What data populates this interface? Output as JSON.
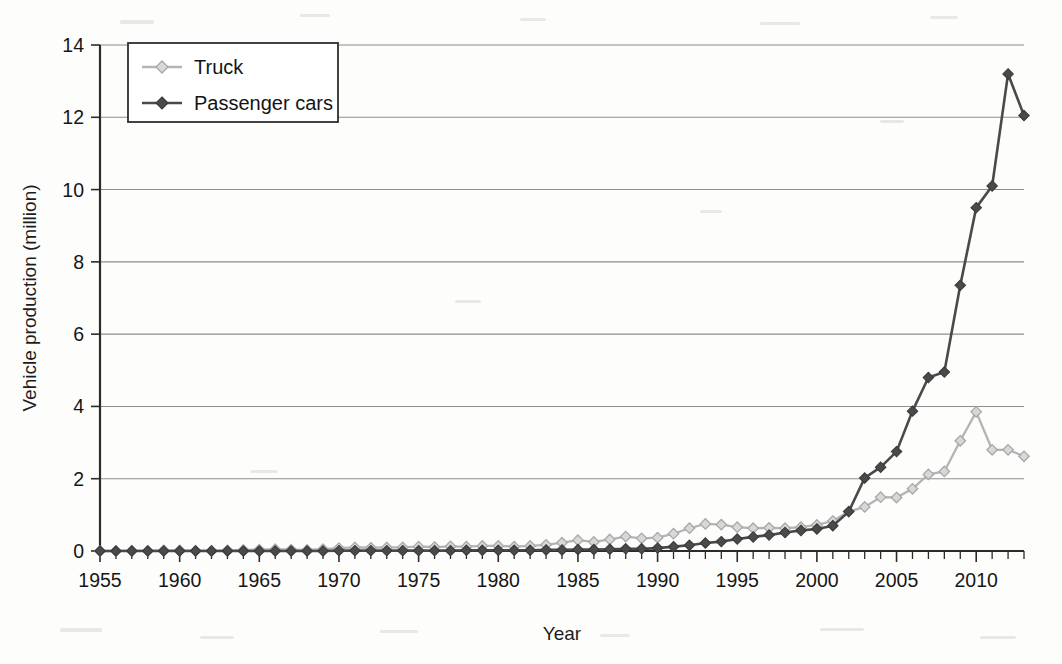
{
  "figure": {
    "background_color": "#fdfdfc",
    "kind": "scanned-line-chart"
  },
  "chart_data": {
    "type": "line",
    "title": "",
    "subtitle": "",
    "xlabel": "Year",
    "ylabel": "Vehicle production (million)",
    "xlim": [
      1955,
      2013
    ],
    "ylim": [
      0,
      14
    ],
    "xticks": [
      1955,
      1960,
      1965,
      1970,
      1975,
      1980,
      1985,
      1990,
      1995,
      2000,
      2005,
      2010
    ],
    "xtick_labels": [
      "1955",
      "1960",
      "1965",
      "1970",
      "1975",
      "1980",
      "1985",
      "1990",
      "1995",
      "2000",
      "2005",
      "2010"
    ],
    "yticks": [
      0,
      2,
      4,
      6,
      8,
      10,
      12,
      14
    ],
    "ytick_labels": [
      "0",
      "2",
      "4",
      "6",
      "8",
      "10",
      "12",
      "14"
    ],
    "minor_xtick_step": 1,
    "grid": "horizontal",
    "legend_position": "upper-left-inside",
    "marker": "diamond",
    "x": [
      1955,
      1956,
      1957,
      1958,
      1959,
      1960,
      1961,
      1962,
      1963,
      1964,
      1965,
      1966,
      1967,
      1968,
      1969,
      1970,
      1971,
      1972,
      1973,
      1974,
      1975,
      1976,
      1977,
      1978,
      1979,
      1980,
      1981,
      1982,
      1983,
      1984,
      1985,
      1986,
      1987,
      1988,
      1989,
      1990,
      1991,
      1992,
      1993,
      1994,
      1995,
      1996,
      1997,
      1998,
      1999,
      2000,
      2001,
      2002,
      2003,
      2004,
      2005,
      2006,
      2007,
      2008,
      2009,
      2010,
      2011,
      2012,
      2013
    ],
    "series": [
      {
        "name": "Truck",
        "color": "#b4b4b4",
        "marker_fill": "#d8d8d8",
        "values": [
          0.0,
          0.0,
          0.01,
          0.01,
          0.02,
          0.02,
          0.01,
          0.01,
          0.02,
          0.03,
          0.04,
          0.05,
          0.04,
          0.03,
          0.05,
          0.08,
          0.1,
          0.09,
          0.1,
          0.1,
          0.12,
          0.11,
          0.13,
          0.12,
          0.14,
          0.14,
          0.12,
          0.14,
          0.17,
          0.23,
          0.3,
          0.25,
          0.32,
          0.4,
          0.35,
          0.37,
          0.48,
          0.63,
          0.75,
          0.73,
          0.66,
          0.63,
          0.64,
          0.63,
          0.66,
          0.72,
          0.83,
          1.09,
          1.22,
          1.49,
          1.48,
          1.72,
          2.12,
          2.2,
          3.05,
          3.85,
          2.8,
          2.8,
          2.62
        ]
      },
      {
        "name": "Passenger cars",
        "color": "#4a4a4a",
        "marker_fill": "#4a4a4a",
        "values": [
          0.0,
          0.0,
          0.0,
          0.0,
          0.0,
          0.0,
          0.0,
          0.0,
          0.0,
          0.0,
          0.0,
          0.0,
          0.0,
          0.0,
          0.0,
          0.01,
          0.01,
          0.01,
          0.01,
          0.01,
          0.01,
          0.01,
          0.01,
          0.02,
          0.02,
          0.02,
          0.02,
          0.02,
          0.03,
          0.03,
          0.04,
          0.04,
          0.05,
          0.06,
          0.06,
          0.08,
          0.12,
          0.16,
          0.22,
          0.26,
          0.33,
          0.39,
          0.44,
          0.51,
          0.57,
          0.61,
          0.7,
          1.09,
          2.02,
          2.32,
          2.75,
          3.87,
          4.8,
          4.95,
          7.35,
          9.5,
          10.1,
          13.2,
          12.05
        ]
      }
    ]
  },
  "legend": {
    "items": [
      {
        "label": "Truck",
        "swatch": "truck-swatch"
      },
      {
        "label": "Passenger cars",
        "swatch": "passenger-cars-swatch"
      }
    ]
  },
  "axes": {
    "y_axis_title": "Vehicle production (million)",
    "x_axis_title": "Year"
  },
  "colors": {
    "truck": "#b4b4b4",
    "passenger_cars": "#4a4a4a",
    "grid": "#8e8e8e",
    "axis": "#2b2b2b",
    "text": "#161616"
  }
}
